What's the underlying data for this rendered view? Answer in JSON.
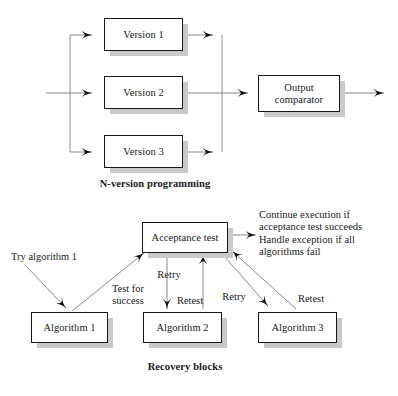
{
  "figure": {
    "title_top": "N-version programming",
    "title_bottom": "Recovery blocks"
  },
  "nversion": {
    "boxes": [
      {
        "label": "Version 1"
      },
      {
        "label": "Version 2"
      },
      {
        "label": "Version 3"
      },
      {
        "label": "Output\ncomparator"
      }
    ]
  },
  "recovery": {
    "boxes": [
      {
        "label": "Acceptance test"
      },
      {
        "label": "Algorithm 1"
      },
      {
        "label": "Algorithm 2"
      },
      {
        "label": "Algorithm 3"
      }
    ],
    "labels": {
      "try_algorithm": "Try algorithm 1",
      "test_for_success": "Test for\nsuccess",
      "retry_1": "Retry",
      "retest_1": "Retest",
      "retry_2": "Retry",
      "retest_2": "Retest",
      "outcome": "Continue execution if\nacceptance test succeeds\nHandle exception if all\nalgorithms fail"
    }
  },
  "style": {
    "box_border": "#171717",
    "shadow": "#c9c9c9",
    "line": "#8a8a8a",
    "arrow": "#111111",
    "text": "#1a1a1a",
    "background": "#ffffff"
  }
}
